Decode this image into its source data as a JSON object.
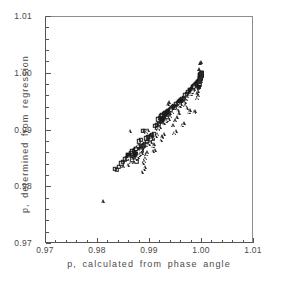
{
  "chart_data": {
    "type": "scatter",
    "title": "",
    "xlabel": "p, calculated from phase angle",
    "ylabel": "p, determined from regression",
    "xlim": [
      0.97,
      1.01
    ],
    "ylim": [
      0.97,
      1.01
    ],
    "xticks": [
      "0.97",
      "0.98",
      "0.99",
      "1.00",
      "1.01"
    ],
    "xtick_values": [
      0.97,
      0.98,
      0.99,
      1.0,
      1.01
    ],
    "yticks": [
      "0.97",
      "0.98",
      "0.99",
      "1.00",
      "1.01"
    ],
    "ytick_values": [
      0.97,
      0.98,
      0.99,
      1.0,
      1.01
    ],
    "minor_ticks_per_interval": 5,
    "grid": false,
    "legend": "none",
    "marker_color": "#1a1a1a",
    "series": [
      {
        "name": "open-square",
        "marker": "square",
        "points": [
          [
            0.9832,
            0.9832
          ],
          [
            0.9836,
            0.9831
          ],
          [
            0.984,
            0.9836
          ],
          [
            0.9845,
            0.9842
          ],
          [
            0.9848,
            0.9845
          ],
          [
            0.9852,
            0.9849
          ],
          [
            0.9855,
            0.9851
          ],
          [
            0.9858,
            0.9856
          ],
          [
            0.9861,
            0.9857
          ],
          [
            0.9864,
            0.986
          ],
          [
            0.9866,
            0.9863
          ],
          [
            0.9869,
            0.9864
          ],
          [
            0.9871,
            0.9866
          ],
          [
            0.9873,
            0.9868
          ],
          [
            0.9876,
            0.9869
          ],
          [
            0.9878,
            0.9871
          ],
          [
            0.988,
            0.9872
          ],
          [
            0.9872,
            0.9858
          ],
          [
            0.9869,
            0.9853
          ],
          [
            0.9866,
            0.9849
          ],
          [
            0.9874,
            0.9846
          ],
          [
            0.9882,
            0.9868
          ],
          [
            0.9886,
            0.9872
          ],
          [
            0.9884,
            0.9865
          ],
          [
            0.9888,
            0.9874
          ],
          [
            0.9891,
            0.9876
          ],
          [
            0.9893,
            0.9886
          ],
          [
            0.9896,
            0.9888
          ],
          [
            0.9899,
            0.9889
          ],
          [
            0.9902,
            0.989
          ],
          [
            0.989,
            0.9899
          ],
          [
            0.9886,
            0.99
          ],
          [
            0.9882,
            0.9884
          ],
          [
            0.9878,
            0.9881
          ],
          [
            0.9904,
            0.9892
          ],
          [
            0.9907,
            0.9893
          ],
          [
            0.991,
            0.9908
          ],
          [
            0.9913,
            0.991
          ],
          [
            0.9916,
            0.992
          ],
          [
            0.9919,
            0.9922
          ],
          [
            0.9922,
            0.9925
          ],
          [
            0.9924,
            0.9927
          ],
          [
            0.9926,
            0.9929
          ],
          [
            0.9928,
            0.993
          ],
          [
            0.993,
            0.9931
          ],
          [
            0.9932,
            0.9933
          ],
          [
            0.9934,
            0.9934
          ],
          [
            0.9936,
            0.9935
          ],
          [
            0.9938,
            0.9936
          ],
          [
            0.9927,
            0.9922
          ],
          [
            0.9925,
            0.992
          ],
          [
            0.9923,
            0.9918
          ],
          [
            0.9921,
            0.9916
          ],
          [
            0.9935,
            0.9928
          ],
          [
            0.994,
            0.9938
          ],
          [
            0.9942,
            0.994
          ],
          [
            0.9944,
            0.9942
          ],
          [
            0.9946,
            0.9944
          ],
          [
            0.9948,
            0.9941
          ],
          [
            0.995,
            0.9946
          ],
          [
            0.9953,
            0.9948
          ],
          [
            0.9956,
            0.995
          ],
          [
            0.9958,
            0.9952
          ],
          [
            0.996,
            0.9953
          ],
          [
            0.9962,
            0.9955
          ],
          [
            0.9965,
            0.9957
          ],
          [
            0.9968,
            0.9962
          ],
          [
            0.9971,
            0.9965
          ],
          [
            0.9974,
            0.9968
          ],
          [
            0.9977,
            0.9971
          ],
          [
            0.998,
            0.9974
          ],
          [
            0.9982,
            0.9976
          ],
          [
            0.9984,
            0.9978
          ],
          [
            0.9986,
            0.998
          ],
          [
            0.9988,
            0.9982
          ],
          [
            0.999,
            0.9984
          ],
          [
            0.9992,
            0.9986
          ],
          [
            0.9994,
            0.9988
          ],
          [
            0.9996,
            0.999
          ],
          [
            0.9997,
            0.9992
          ],
          [
            0.9998,
            0.9994
          ],
          [
            0.9998,
            0.9996
          ],
          [
            0.9999,
            0.9997
          ],
          [
            0.9999,
            0.9998
          ],
          [
            1.0,
            0.9999
          ],
          [
            1.0,
            1.0
          ],
          [
            1.0,
            1.0001
          ],
          [
            0.9999,
            1.0
          ],
          [
            0.9998,
            0.9999
          ],
          [
            0.9997,
            0.9998
          ],
          [
            0.9995,
            0.998
          ],
          [
            0.9993,
            0.9977
          ],
          [
            0.9991,
            0.9975
          ],
          [
            0.9905,
            0.9885
          ],
          [
            0.99,
            0.9883
          ],
          [
            0.9895,
            0.988
          ],
          [
            0.9914,
            0.9905
          ],
          [
            0.9917,
            0.9912
          ],
          [
            0.9933,
            0.9924
          ],
          [
            0.9937,
            0.9932
          ]
        ]
      },
      {
        "name": "open-triangle",
        "marker": "triangle",
        "points": [
          [
            0.981,
            0.9775
          ],
          [
            0.9849,
            0.9837
          ],
          [
            0.9857,
            0.984
          ],
          [
            0.9862,
            0.9855
          ],
          [
            0.9864,
            0.9845
          ],
          [
            0.9867,
            0.9851
          ],
          [
            0.987,
            0.9844
          ],
          [
            0.9873,
            0.985
          ],
          [
            0.9876,
            0.9854
          ],
          [
            0.9879,
            0.9857
          ],
          [
            0.9881,
            0.9859
          ],
          [
            0.9884,
            0.9861
          ],
          [
            0.9862,
            0.99
          ],
          [
            0.9875,
            0.987
          ],
          [
            0.9878,
            0.9875
          ],
          [
            0.9882,
            0.9866
          ],
          [
            0.9885,
            0.9869
          ],
          [
            0.9887,
            0.9843
          ],
          [
            0.9889,
            0.9847
          ],
          [
            0.9891,
            0.9852
          ],
          [
            0.9893,
            0.9858
          ],
          [
            0.9895,
            0.9862
          ],
          [
            0.9884,
            0.9827
          ],
          [
            0.9888,
            0.9833
          ],
          [
            0.989,
            0.9836
          ],
          [
            0.9893,
            0.9898
          ],
          [
            0.9896,
            0.9901
          ],
          [
            0.9898,
            0.9877
          ],
          [
            0.9901,
            0.988
          ],
          [
            0.9903,
            0.9887
          ],
          [
            0.9905,
            0.9872
          ],
          [
            0.9908,
            0.9876
          ],
          [
            0.9911,
            0.9891
          ],
          [
            0.9914,
            0.9894
          ],
          [
            0.9916,
            0.9903
          ],
          [
            0.9919,
            0.9907
          ],
          [
            0.9921,
            0.9884
          ],
          [
            0.9924,
            0.9888
          ],
          [
            0.9927,
            0.9913
          ],
          [
            0.993,
            0.9917
          ],
          [
            0.9933,
            0.9919
          ],
          [
            0.9936,
            0.9921
          ],
          [
            0.9939,
            0.9926
          ],
          [
            0.9941,
            0.9939
          ],
          [
            0.9943,
            0.9933
          ],
          [
            0.9945,
            0.9909
          ],
          [
            0.9947,
            0.9896
          ],
          [
            0.995,
            0.99
          ],
          [
            0.9953,
            0.9937
          ],
          [
            0.9956,
            0.993
          ],
          [
            0.9958,
            0.9943
          ],
          [
            0.996,
            0.9947
          ],
          [
            0.9962,
            0.991
          ],
          [
            0.9965,
            0.9913
          ],
          [
            0.9967,
            0.9951
          ],
          [
            0.997,
            0.9955
          ],
          [
            0.9972,
            0.996
          ],
          [
            0.9975,
            0.9932
          ],
          [
            0.9977,
            0.9936
          ],
          [
            0.9979,
            0.9964
          ],
          [
            0.9981,
            0.9967
          ],
          [
            0.9983,
            0.9971
          ],
          [
            0.9985,
            0.9933
          ],
          [
            0.9987,
            0.9934
          ],
          [
            0.9989,
            0.9975
          ],
          [
            0.9991,
            0.9958
          ],
          [
            0.9993,
            0.9962
          ],
          [
            0.9995,
            0.9986
          ],
          [
            0.9996,
            0.9989
          ],
          [
            0.9997,
            0.9993
          ],
          [
            0.9998,
            0.9987
          ],
          [
            0.9999,
            0.9995
          ],
          [
            1.0,
            0.9998
          ],
          [
            1.0,
            1.0003
          ],
          [
            0.9999,
            1.0002
          ],
          [
            0.9998,
            1.002
          ],
          [
            0.9997,
            1.0019
          ],
          [
            0.9994,
            1.0008
          ],
          [
            0.9992,
            0.997
          ],
          [
            0.999,
            0.9966
          ],
          [
            0.9986,
            0.9979
          ],
          [
            0.9984,
            0.9973
          ],
          [
            0.9971,
            0.994
          ],
          [
            0.9968,
            0.9945
          ],
          [
            0.9952,
            0.9923
          ],
          [
            0.9949,
            0.9918
          ],
          [
            0.9937,
            0.995
          ],
          [
            0.9934,
            0.9946
          ],
          [
            0.9926,
            0.9894
          ],
          [
            0.9923,
            0.989
          ],
          [
            0.9909,
            0.9866
          ],
          [
            0.9906,
            0.9864
          ]
        ]
      }
    ]
  }
}
